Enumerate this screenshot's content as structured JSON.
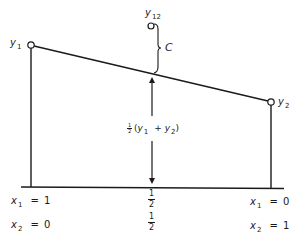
{
  "diagram": {
    "type": "linear-mixing-line",
    "points": {
      "y1": {
        "label": "y",
        "subscript": "1"
      },
      "y2": {
        "label": "y",
        "subscript": "2"
      },
      "y12": {
        "label": "y",
        "subscript": "12"
      }
    },
    "brace_label": "C",
    "midpoint_label": {
      "frac_num": "1",
      "frac_den": "2",
      "open": "(",
      "var1": "y",
      "sub1": "1",
      "plus": "+",
      "var2": "y",
      "sub2": "2",
      "close": ")"
    },
    "axis": {
      "left": {
        "x1": {
          "var": "x",
          "sub": "1",
          "eq": "=",
          "value": "1"
        },
        "x2": {
          "var": "x",
          "sub": "2",
          "eq": "=",
          "value": "0"
        }
      },
      "center": {
        "x1": {
          "num": "1",
          "den": "2"
        },
        "x2": {
          "num": "1",
          "den": "2"
        }
      },
      "right": {
        "x1": {
          "var": "x",
          "sub": "1",
          "eq": "=",
          "value": "0"
        },
        "x2": {
          "var": "x",
          "sub": "2",
          "eq": "=",
          "value": "1"
        }
      }
    },
    "colors": {
      "ink": "#1a1a1a",
      "background": "#ffffff"
    }
  }
}
